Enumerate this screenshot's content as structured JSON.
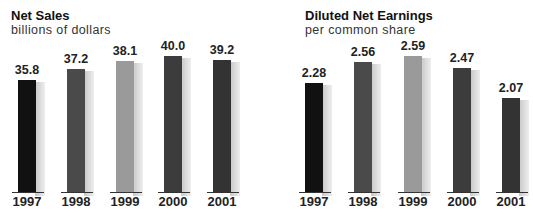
{
  "chart_data": [
    {
      "type": "bar",
      "title": "Net Sales",
      "subtitle": "billions of dollars",
      "categories": [
        "1997",
        "1998",
        "1999",
        "2000",
        "2001"
      ],
      "values": [
        35.8,
        37.2,
        38.1,
        40.0,
        39.2
      ],
      "value_labels": [
        "35.8",
        "37.2",
        "38.1",
        "40.0",
        "39.2"
      ],
      "bar_colors": [
        "#111111",
        "#4a4a4a",
        "#9a9a9a",
        "#3c3c3c",
        "#333333"
      ],
      "xlabel": "",
      "ylabel": "",
      "grid": false,
      "legend": "none"
    },
    {
      "type": "bar",
      "title": "Diluted Net Earnings",
      "subtitle": "per common share",
      "categories": [
        "1997",
        "1998",
        "1999",
        "2000",
        "2001"
      ],
      "values": [
        2.28,
        2.56,
        2.59,
        2.47,
        2.07
      ],
      "value_labels": [
        "2.28",
        "2.56",
        "2.59",
        "2.47",
        "2.07"
      ],
      "bar_colors": [
        "#111111",
        "#4a4a4a",
        "#9a9a9a",
        "#3c3c3c",
        "#333333"
      ],
      "xlabel": "",
      "ylabel": "",
      "grid": false,
      "legend": "none"
    }
  ],
  "left": {
    "title": "Net Sales",
    "subtitle": "billions of dollars",
    "labels": [
      "35.8",
      "37.2",
      "38.1",
      "40.0",
      "39.2"
    ],
    "years": [
      "1997",
      "1998",
      "1999",
      "2000",
      "2001"
    ]
  },
  "right": {
    "title": "Diluted Net Earnings",
    "subtitle": "per common share",
    "labels": [
      "2.28",
      "2.56",
      "2.59",
      "2.47",
      "2.07"
    ],
    "years": [
      "1997",
      "1998",
      "1999",
      "2000",
      "2001"
    ]
  }
}
